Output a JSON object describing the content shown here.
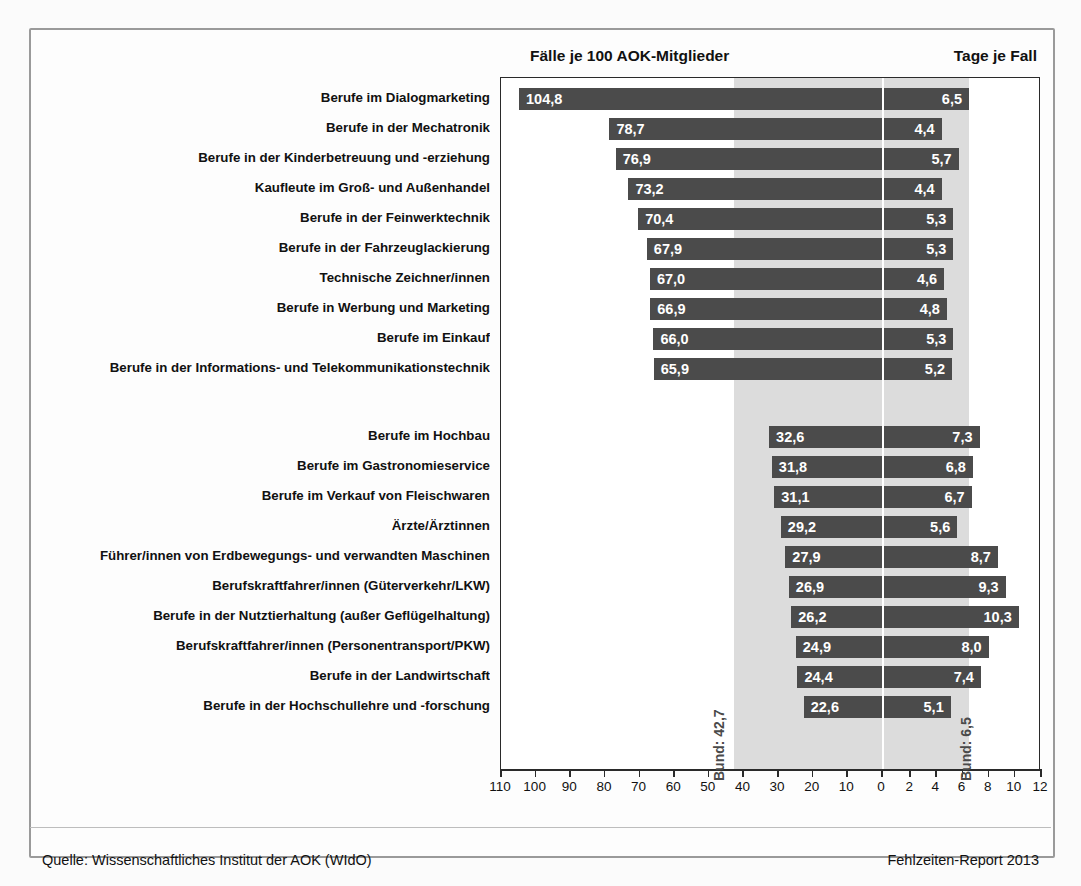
{
  "headers": {
    "left": "Fälle je 100 AOK-Mitglieder",
    "right": "Tage je Fall"
  },
  "footer": {
    "source": "Quelle: Wissenschaftliches Institut der AOK (WIdO)",
    "report": "Fehlzeiten-Report 2013"
  },
  "reference": {
    "left_label": "Bund: 42,7",
    "right_label": "Bund: 6,5",
    "left_value": 42.7,
    "right_value": 6.5
  },
  "axis": {
    "left_ticks": [
      "110",
      "100",
      "90",
      "80",
      "70",
      "60",
      "50",
      "40",
      "30",
      "20",
      "10",
      "0"
    ],
    "right_ticks": [
      "0",
      "2",
      "4",
      "6",
      "8",
      "10",
      "12"
    ]
  },
  "chart_data": {
    "type": "bar",
    "orientation": "horizontal",
    "layout": "diverging-dual-axis",
    "xlabel_left": "Fälle je 100 AOK-Mitglieder",
    "xlabel_right": "Tage je Fall",
    "xlim_left": [
      0,
      110
    ],
    "xlim_right": [
      0,
      12
    ],
    "grid": false,
    "legend": "none",
    "reference_lines": {
      "left": 42.7,
      "right": 6.5
    },
    "categories": [
      "Berufe im Dialogmarketing",
      "Berufe in der Mechatronik",
      "Berufe in der Kinderbetreuung und -erziehung",
      "Kaufleute im Groß- und Außenhandel",
      "Berufe in der Feinwerktechnik",
      "Berufe in der Fahrzeuglackierung",
      "Technische Zeichner/innen",
      "Berufe in Werbung und Marketing",
      "Berufe im Einkauf",
      "Berufe in der Informations- und Telekommunikationstechnik",
      "Berufe im Hochbau",
      "Berufe im Gastronomieservice",
      "Berufe im Verkauf von Fleischwaren",
      "Ärzte/Ärztinnen",
      "Führer/innen von Erdbewegungs- und verwandten Maschinen",
      "Berufskraftfahrer/innen (Güterverkehr/LKW)",
      "Berufe in der Nutztierhaltung (außer Geflügelhaltung)",
      "Berufskraftfahrer/innen (Personentransport/PKW)",
      "Berufe in der Landwirtschaft",
      "Berufe in der Hochschullehre und -forschung"
    ],
    "series": [
      {
        "name": "Fälle je 100 AOK-Mitglieder",
        "values": [
          104.8,
          78.7,
          76.9,
          73.2,
          70.4,
          67.9,
          67.0,
          66.9,
          66.0,
          65.9,
          32.6,
          31.8,
          31.1,
          29.2,
          27.9,
          26.9,
          26.2,
          24.9,
          24.4,
          22.6
        ],
        "labels": [
          "104,8",
          "78,7",
          "76,9",
          "73,2",
          "70,4",
          "67,9",
          "67,0",
          "66,9",
          "66,0",
          "65,9",
          "32,6",
          "31,8",
          "31,1",
          "29,2",
          "27,9",
          "26,9",
          "26,2",
          "24,9",
          "24,4",
          "22,6"
        ]
      },
      {
        "name": "Tage je Fall",
        "values": [
          6.5,
          4.4,
          5.7,
          4.4,
          5.3,
          5.3,
          4.6,
          4.8,
          5.3,
          5.2,
          7.3,
          6.8,
          6.7,
          5.6,
          8.7,
          9.3,
          10.3,
          8.0,
          7.4,
          5.1
        ],
        "labels": [
          "6,5",
          "4,4",
          "5,7",
          "4,4",
          "5,3",
          "5,3",
          "4,6",
          "4,8",
          "5,3",
          "5,2",
          "7,3",
          "6,8",
          "6,7",
          "5,6",
          "8,7",
          "9,3",
          "10,3",
          "8,0",
          "7,4",
          "5,1"
        ]
      }
    ],
    "group_break_after_index": 9
  },
  "colors": {
    "bar": "#4b4b4b",
    "band": "#dcdcdc",
    "frame": "#9a9a9a",
    "axis": "#2a2a2a"
  }
}
